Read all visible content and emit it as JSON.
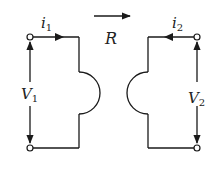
{
  "diagram": {
    "type": "two-port network (facing ports)",
    "left_port": {
      "current_symbol": "i",
      "current_subscript": "1",
      "voltage_symbol": "V",
      "voltage_subscript": "1",
      "current_direction": "right"
    },
    "right_port": {
      "current_symbol": "i",
      "current_subscript": "2",
      "voltage_symbol": "V",
      "voltage_subscript": "2",
      "current_direction": "left"
    },
    "operator": {
      "label": "R",
      "arrow_direction": "right"
    },
    "colors": {
      "stroke": "#1a1a1a",
      "background": "#ffffff"
    }
  }
}
